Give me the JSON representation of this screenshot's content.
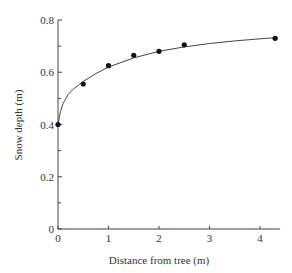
{
  "chart_data": {
    "type": "scatter",
    "title": "",
    "xlabel": "Distance from tree (m)",
    "ylabel": "Snow depth (m)",
    "xlim": [
      0,
      4.4
    ],
    "ylim": [
      0,
      0.8
    ],
    "x_ticks": [
      0,
      1,
      2,
      3,
      4
    ],
    "x_tick_labels": [
      "0",
      "1",
      "2",
      "3",
      "4"
    ],
    "y_ticks": [
      0,
      0.2,
      0.4,
      0.6,
      0.8
    ],
    "y_tick_labels": [
      "0",
      "0.2",
      "0.4",
      "0.6",
      "0.8"
    ],
    "y_minor_ticks": [
      0.1,
      0.3,
      0.5,
      0.7
    ],
    "grid": false,
    "legend": null,
    "series": [
      {
        "name": "observations",
        "marker": "filled-circle",
        "x": [
          0,
          0.5,
          1.0,
          1.5,
          2.0,
          2.5,
          4.3
        ],
        "y": [
          0.4,
          0.555,
          0.625,
          0.665,
          0.68,
          0.705,
          0.73
        ]
      }
    ],
    "fit_curve": {
      "description": "smooth saturating fitted curve through points",
      "x": [
        0,
        0.05,
        0.1,
        0.2,
        0.3,
        0.5,
        0.75,
        1.0,
        1.5,
        2.0,
        2.5,
        3.0,
        3.5,
        4.0,
        4.35
      ],
      "y": [
        0.4,
        0.45,
        0.48,
        0.515,
        0.535,
        0.565,
        0.595,
        0.62,
        0.655,
        0.68,
        0.697,
        0.71,
        0.72,
        0.728,
        0.733
      ]
    }
  }
}
